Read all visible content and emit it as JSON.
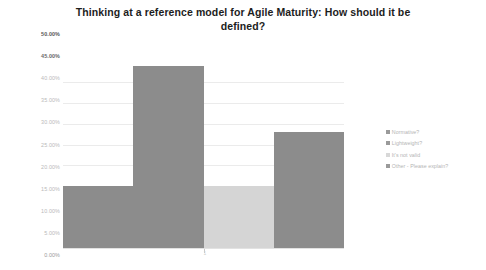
{
  "chart_data": {
    "type": "bar",
    "title": "Thinking at a reference model for Agile Maturity: How should it be defined?",
    "title_line1": "Thinking at a reference model for Agile Maturity: How should it be",
    "title_line2": "defined?",
    "xlabel": "",
    "ylabel": "",
    "categories": [
      "1"
    ],
    "xtick_labels": [
      "1"
    ],
    "ylim": [
      0,
      50
    ],
    "ytick_labels": [
      "50.00%",
      "45.00%",
      "40.00%",
      "35.00%",
      "30.00%",
      "25.00%",
      "20.00%",
      "15.00%",
      "10.00%",
      "5.00%",
      "0.00%"
    ],
    "ytick_values": [
      50,
      45,
      40,
      35,
      30,
      25,
      20,
      15,
      10,
      5,
      0
    ],
    "grid": true,
    "legend_position": "right",
    "series": [
      {
        "name": "Normative?",
        "values": [
          15
        ],
        "color": "#8c8c8c"
      },
      {
        "name": "Lightweight?",
        "values": [
          44
        ],
        "color": "#8c8c8c"
      },
      {
        "name": "It's not valid",
        "values": [
          15
        ],
        "color": "#d5d5d5"
      },
      {
        "name": "Other - Please explain?",
        "values": [
          28
        ],
        "color": "#8c8c8c"
      }
    ]
  },
  "legend": {
    "items": [
      {
        "label": "Normative?",
        "color": "#9a9a9a"
      },
      {
        "label": "Lightweight?",
        "color": "#9a9a9a"
      },
      {
        "label": "It's not valid",
        "color": "#d8d8d8"
      },
      {
        "label": "Other - Please explain?",
        "color": "#9a9a9a"
      }
    ]
  }
}
